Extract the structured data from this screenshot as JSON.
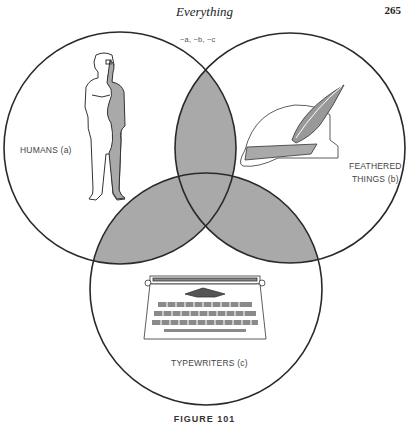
{
  "page": {
    "running_head": "Everything",
    "page_number": "265",
    "caption": "FIGURE 101"
  },
  "diagram": {
    "type": "venn",
    "outside_label": "~a, ~b, ~c",
    "sets": [
      {
        "id": "a",
        "label": "HUMANS (a)",
        "illustration": "human-figure"
      },
      {
        "id": "b",
        "label_line1": "FEATHERED",
        "label_line2": "THINGS (b)",
        "illustration": "feathered-hat"
      },
      {
        "id": "c",
        "label": "TYPEWRITERS (c)",
        "illustration": "typewriter"
      }
    ],
    "shaded_regions": [
      "a∩b",
      "a∩c",
      "b∩c"
    ],
    "colors": {
      "line": "#2a2a2a",
      "shade": "#a9a9a9",
      "background": "#ffffff"
    }
  }
}
